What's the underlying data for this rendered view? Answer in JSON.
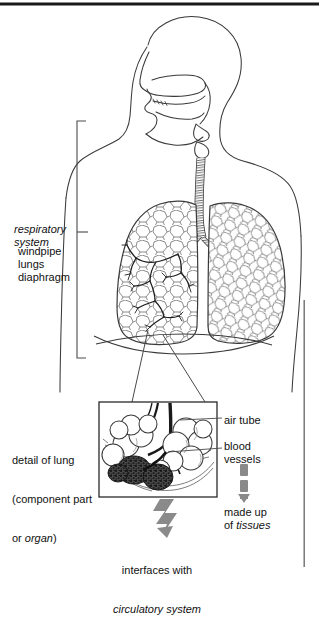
{
  "figure": {
    "type": "anatomical-diagram",
    "frame": {
      "top_rule_color": "#1a1a1a",
      "right_rule_color": "#6f6f6f"
    }
  },
  "labels": {
    "system_name": "respiratory\nsystem",
    "system_parts": "windpipe\nlungs\ndiaphragm",
    "detail_caption_line1": "detail of lung",
    "detail_caption_line2": "(component part",
    "detail_caption_line3_pre": "or ",
    "detail_caption_line3_em": "organ",
    "detail_caption_line3_post": ")",
    "air_tube": "air tube",
    "blood_vessels": "blood\nvessels",
    "made_up_pre": "made up\nof ",
    "made_up_em": "tissues",
    "interfaces_pre": "interfaces with",
    "interfaces_em": "circulatory system"
  },
  "parts": [
    {
      "name": "head-profile",
      "description": "side view of head with nasal and oral cavity"
    },
    {
      "name": "trachea",
      "description": "windpipe with cartilage rings"
    },
    {
      "name": "bronchi",
      "description": "branching airways into each lung"
    },
    {
      "name": "left-lung",
      "description": "lung with bronchial tree and alveolar texture"
    },
    {
      "name": "right-lung",
      "description": "lung with alveolar texture"
    },
    {
      "name": "diaphragm",
      "description": "dome shaped muscle below lungs"
    },
    {
      "name": "alveoli-cluster",
      "description": "detail of alveoli sacs with capillaries"
    }
  ],
  "colors": {
    "ink": "#1a1a1a",
    "line": "#3a3a3a",
    "hairline": "#555555",
    "arrow_gray": "#8a8a8a",
    "alveoli_dark": "#3b3b3b"
  },
  "arrows": {
    "dashed_down": {
      "dashes": 2,
      "direction": "down",
      "color": "#8a8a8a"
    },
    "zigzag_down": {
      "direction": "down",
      "color": "#8a8a8a"
    }
  }
}
